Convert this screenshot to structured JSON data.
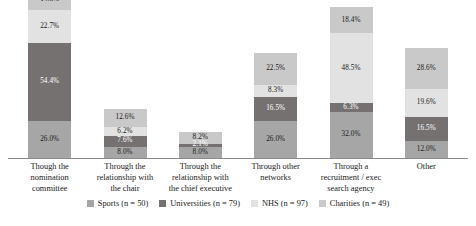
{
  "chart_data": {
    "type": "bar",
    "subtype": "stacked-column-percentage",
    "title": "",
    "subtitle": "",
    "xlabel": "",
    "ylabel": "",
    "ylim": [
      0,
      110
    ],
    "grid": false,
    "legend_position": "bottom",
    "stack_order_bottom_to_top": [
      "Sports (n = 50)",
      "Universities (n = 79)",
      "NHS (n = 97)",
      "Charities (n = 49)"
    ],
    "categories": [
      "Though the nomination committee",
      "Through the relationship with the chair",
      "Through the relationship with the chief executive",
      "Through other networks",
      "Through a recruitment / exec search agency",
      "Other"
    ],
    "category_lines": [
      [
        "Though the",
        "nomination",
        "committee"
      ],
      [
        "Through the",
        "relationship with",
        "the chair"
      ],
      [
        "Through the",
        "relationship with",
        "the chief executive"
      ],
      [
        "Through other",
        "networks"
      ],
      [
        "Through a",
        "recruitment / exec",
        "search agency"
      ],
      [
        "Other"
      ]
    ],
    "series": [
      {
        "name": "Sports (n = 50)",
        "color": "#a6a6a6",
        "label_color": "dark",
        "values": [
          26.0,
          8.0,
          8.0,
          26.0,
          32.0,
          12.0
        ],
        "labels": [
          "26.0%",
          "8.0%",
          "8.0%",
          "26.0%",
          "32.0%",
          "12.0%"
        ]
      },
      {
        "name": "Universities (n = 79)",
        "color": "#767171",
        "label_color": "light",
        "values": [
          54.4,
          7.6,
          2.1,
          16.5,
          6.3,
          16.5
        ],
        "labels": [
          "54.4%",
          "7.6%",
          "2.1%",
          "16.5%",
          "6.3%",
          "16.5%"
        ]
      },
      {
        "name": "NHS (n = 97)",
        "color": "#e2e2e2",
        "label_color": "dark",
        "values": [
          22.7,
          6.2,
          0.0,
          8.3,
          48.5,
          19.6
        ],
        "labels": [
          "22.7%",
          "6.2%",
          "",
          "8.3%",
          "48.5%",
          "19.6%"
        ]
      },
      {
        "name": "Charities (n = 49)",
        "color": "#c9c9c9",
        "label_color": "dark",
        "values": [
          14.3,
          12.6,
          8.2,
          22.5,
          18.4,
          28.6
        ],
        "labels": [
          "14.3%",
          "12.6%",
          "8.2%",
          "22.5%",
          "18.4%",
          "28.6%"
        ]
      }
    ]
  },
  "legend": {
    "items": [
      {
        "label": "Sports (n = 50)",
        "color": "#a6a6a6"
      },
      {
        "label": "Universities (n = 79)",
        "color": "#767171"
      },
      {
        "label": "NHS (n = 97)",
        "color": "#e2e2e2"
      },
      {
        "label": "Charities (n = 49)",
        "color": "#c9c9c9"
      }
    ]
  }
}
